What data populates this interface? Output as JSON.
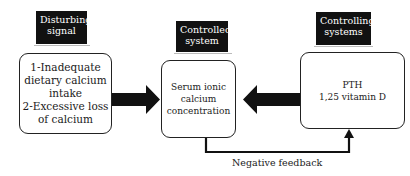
{
  "labels": {
    "disturbing": [
      "Disturbing",
      "signal"
    ],
    "controlled": [
      "Controlled",
      "system"
    ],
    "controlling": [
      "Controlling",
      "systems"
    ]
  },
  "boxes": {
    "disturbing": [
      "1-Inadequate",
      "dietary calcium",
      "intake",
      "2-Excessive loss",
      "of calcium"
    ],
    "controlled": [
      "Serum ionic",
      "calcium",
      "concentration"
    ],
    "controlling": [
      "PTH",
      "1,25 vitamin D"
    ]
  },
  "feedback": {
    "label": "Negative feedback"
  },
  "colors": {
    "label_bg": "#111111",
    "arrow": "#111111",
    "line": "#222222"
  }
}
